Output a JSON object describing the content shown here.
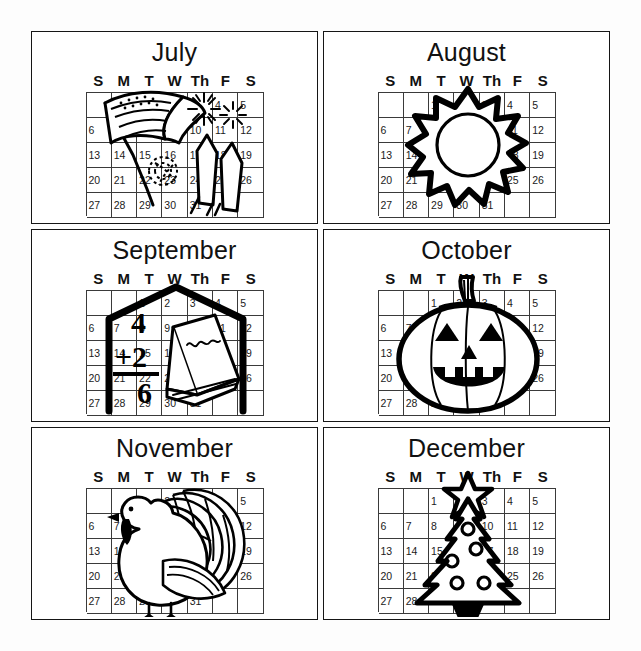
{
  "page": {
    "background_color": "#ffffff",
    "ink_color": "#111111",
    "layout": "2 columns x 3 rows of month panels"
  },
  "weekday_headers": [
    "S",
    "M",
    "T",
    "W",
    "Th",
    "F",
    "S"
  ],
  "calendar_grid": {
    "columns": 7,
    "rows": 5,
    "cells": [
      "",
      "",
      "1",
      "2",
      "3",
      "4",
      "5",
      "6",
      "7",
      "8",
      "9",
      "10",
      "11",
      "12",
      "13",
      "14",
      "15",
      "16",
      "17",
      "18",
      "19",
      "20",
      "21",
      "22",
      "23",
      "24",
      "25",
      "26",
      "27",
      "28",
      "29",
      "30",
      "31",
      "",
      ""
    ]
  },
  "months": [
    {
      "name": "July",
      "illustration": "american-flag-and-fireworks",
      "illustration_elements": [
        "flag",
        "firework-burst",
        "firework-burst",
        "pinwheel-spark",
        "rocket",
        "rocket"
      ],
      "visible_numbers": [
        "6",
        "13",
        "20",
        "21",
        "27",
        "28",
        "29",
        "30",
        "2",
        "9",
        "26"
      ]
    },
    {
      "name": "August",
      "illustration": "sun",
      "illustration_elements": [
        "sun-rays",
        "sun-disc"
      ],
      "visible_numbers": [
        "4",
        "5",
        "6",
        "12",
        "13",
        "19",
        "20",
        "25",
        "26",
        "27",
        "28",
        "29",
        "31"
      ]
    },
    {
      "name": "September",
      "illustration": "schoolhouse-with-math-and-book",
      "illustration_elements": [
        "schoolhouse-outline",
        "addition-problem",
        "book"
      ],
      "math_problem": {
        "addend_top": "4",
        "addend_bottom": "+2",
        "sum": "6"
      },
      "visible_numbers": [
        "5",
        "12",
        "19",
        "26",
        "6",
        "13",
        "20",
        "27"
      ]
    },
    {
      "name": "October",
      "illustration": "jack-o-lantern",
      "illustration_elements": [
        "pumpkin-body",
        "stem",
        "triangle-eyes",
        "triangle-nose",
        "toothy-grin"
      ],
      "visible_numbers": [
        "5",
        "6",
        "12",
        "13",
        "19",
        "20",
        "26",
        "27",
        "28"
      ]
    },
    {
      "name": "November",
      "illustration": "turkey",
      "illustration_elements": [
        "turkey-body",
        "tail-feathers",
        "head",
        "wattle",
        "legs"
      ],
      "visible_numbers": [
        "5",
        "6",
        "12",
        "13",
        "14",
        "19",
        "20",
        "21",
        "26",
        "27",
        "28",
        "29",
        "31"
      ]
    },
    {
      "name": "December",
      "illustration": "christmas-tree",
      "illustration_elements": [
        "star-topper",
        "tree-body",
        "ornaments",
        "tree-stand"
      ],
      "visible_numbers": [
        "1",
        "3",
        "4",
        "5",
        "6",
        "7",
        "11",
        "12",
        "13",
        "14",
        "18",
        "19",
        "20",
        "21",
        "25",
        "26",
        "27",
        "28",
        "29",
        "31"
      ]
    }
  ]
}
